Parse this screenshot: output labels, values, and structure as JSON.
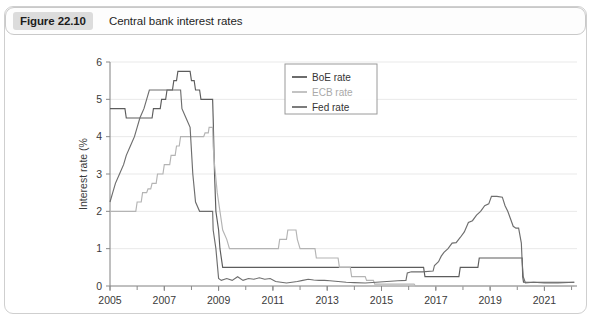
{
  "figure": {
    "badge": "Figure 22.10",
    "title": "Central bank interest rates"
  },
  "colors": {
    "boe": "#5c5c5c",
    "ecb": "#b4b4b4",
    "fed": "#6e6e6e",
    "axis": "#808080",
    "grid": "#e9e9e9",
    "badge_bg": "#dcdcdc"
  },
  "legend": {
    "position": "top-right",
    "entries": [
      {
        "label": "BoE rate",
        "color": "#5c5c5c"
      },
      {
        "label": "ECB rate",
        "color": "#b4b4b4"
      },
      {
        "label": "Fed rate",
        "color": "#6e6e6e"
      }
    ]
  },
  "axes": {
    "y": {
      "label": "Interest rate (%",
      "ticks": [
        "0",
        "1",
        "2",
        "3",
        "4",
        "5",
        "6"
      ],
      "min": 0,
      "max": 6
    },
    "x": {
      "label": "",
      "ticks": [
        "2005",
        "2007",
        "2009",
        "2011",
        "2013",
        "2015",
        "2017",
        "2019",
        "2021"
      ],
      "minor_ticks": [
        "2006",
        "2008",
        "2010",
        "2012",
        "2014",
        "2016",
        "2018",
        "2020",
        "2022"
      ],
      "min": 2005,
      "max": 2022.2
    }
  },
  "chart_data": {
    "type": "line",
    "title": "Central bank interest rates",
    "xlabel": "",
    "ylabel": "Interest rate (%)",
    "xlim": [
      2005,
      2022.2
    ],
    "ylim": [
      0,
      6
    ],
    "grid": true,
    "legend_position": "top-right",
    "series": [
      {
        "name": "BoE rate",
        "color": "#5c5c5c",
        "points": [
          [
            2005.0,
            4.75
          ],
          [
            2005.55,
            4.75
          ],
          [
            2005.6,
            4.5
          ],
          [
            2006.55,
            4.5
          ],
          [
            2006.6,
            4.75
          ],
          [
            2006.85,
            4.75
          ],
          [
            2006.9,
            5.0
          ],
          [
            2007.05,
            5.0
          ],
          [
            2007.1,
            5.25
          ],
          [
            2007.3,
            5.25
          ],
          [
            2007.35,
            5.5
          ],
          [
            2007.45,
            5.5
          ],
          [
            2007.5,
            5.75
          ],
          [
            2007.95,
            5.75
          ],
          [
            2008.0,
            5.5
          ],
          [
            2008.1,
            5.5
          ],
          [
            2008.15,
            5.25
          ],
          [
            2008.3,
            5.25
          ],
          [
            2008.35,
            5.0
          ],
          [
            2008.78,
            5.0
          ],
          [
            2008.8,
            4.5
          ],
          [
            2008.85,
            3.0
          ],
          [
            2008.9,
            2.0
          ],
          [
            2009.0,
            1.5
          ],
          [
            2009.05,
            1.0
          ],
          [
            2009.15,
            0.5
          ],
          [
            2016.55,
            0.5
          ],
          [
            2016.6,
            0.25
          ],
          [
            2017.85,
            0.25
          ],
          [
            2017.9,
            0.5
          ],
          [
            2018.55,
            0.5
          ],
          [
            2018.6,
            0.75
          ],
          [
            2020.18,
            0.75
          ],
          [
            2020.2,
            0.25
          ],
          [
            2020.23,
            0.1
          ],
          [
            2022.1,
            0.1
          ]
        ]
      },
      {
        "name": "ECB rate",
        "color": "#b4b4b4",
        "points": [
          [
            2005.0,
            2.0
          ],
          [
            2005.95,
            2.0
          ],
          [
            2006.0,
            2.25
          ],
          [
            2006.15,
            2.25
          ],
          [
            2006.2,
            2.5
          ],
          [
            2006.35,
            2.5
          ],
          [
            2006.4,
            2.6
          ],
          [
            2006.5,
            2.6
          ],
          [
            2006.55,
            2.75
          ],
          [
            2006.7,
            2.75
          ],
          [
            2006.75,
            3.0
          ],
          [
            2006.95,
            3.0
          ],
          [
            2007.0,
            3.25
          ],
          [
            2007.2,
            3.25
          ],
          [
            2007.25,
            3.5
          ],
          [
            2007.4,
            3.5
          ],
          [
            2007.45,
            3.75
          ],
          [
            2007.55,
            3.75
          ],
          [
            2007.6,
            4.0
          ],
          [
            2008.45,
            4.0
          ],
          [
            2008.5,
            4.1
          ],
          [
            2008.62,
            4.1
          ],
          [
            2008.65,
            4.25
          ],
          [
            2008.78,
            4.25
          ],
          [
            2008.8,
            3.75
          ],
          [
            2008.85,
            3.25
          ],
          [
            2008.95,
            2.5
          ],
          [
            2009.05,
            2.0
          ],
          [
            2009.15,
            1.5
          ],
          [
            2009.3,
            1.25
          ],
          [
            2009.4,
            1.0
          ],
          [
            2011.2,
            1.0
          ],
          [
            2011.25,
            1.25
          ],
          [
            2011.5,
            1.25
          ],
          [
            2011.55,
            1.5
          ],
          [
            2011.85,
            1.5
          ],
          [
            2011.9,
            1.25
          ],
          [
            2012.0,
            1.0
          ],
          [
            2012.55,
            1.0
          ],
          [
            2012.6,
            0.75
          ],
          [
            2013.4,
            0.75
          ],
          [
            2013.45,
            0.5
          ],
          [
            2013.85,
            0.5
          ],
          [
            2013.9,
            0.25
          ],
          [
            2014.4,
            0.25
          ],
          [
            2014.45,
            0.15
          ],
          [
            2014.7,
            0.15
          ],
          [
            2014.75,
            0.05
          ],
          [
            2016.2,
            0.05
          ],
          [
            2016.25,
            0.0
          ],
          [
            2022.1,
            0.0
          ]
        ]
      },
      {
        "name": "Fed rate",
        "color": "#6e6e6e",
        "points": [
          [
            2005.0,
            2.25
          ],
          [
            2005.1,
            2.5
          ],
          [
            2005.2,
            2.75
          ],
          [
            2005.35,
            3.0
          ],
          [
            2005.5,
            3.25
          ],
          [
            2005.6,
            3.5
          ],
          [
            2005.75,
            3.75
          ],
          [
            2005.9,
            4.0
          ],
          [
            2006.0,
            4.25
          ],
          [
            2006.1,
            4.5
          ],
          [
            2006.25,
            4.75
          ],
          [
            2006.35,
            5.0
          ],
          [
            2006.45,
            5.25
          ],
          [
            2007.6,
            5.25
          ],
          [
            2007.65,
            4.75
          ],
          [
            2007.8,
            4.5
          ],
          [
            2007.95,
            4.25
          ],
          [
            2008.05,
            3.0
          ],
          [
            2008.15,
            2.25
          ],
          [
            2008.3,
            2.0
          ],
          [
            2008.78,
            2.0
          ],
          [
            2008.8,
            1.5
          ],
          [
            2008.9,
            1.0
          ],
          [
            2009.0,
            0.2
          ],
          [
            2009.1,
            0.15
          ],
          [
            2009.3,
            0.2
          ],
          [
            2009.5,
            0.15
          ],
          [
            2009.7,
            0.25
          ],
          [
            2009.9,
            0.15
          ],
          [
            2010.1,
            0.2
          ],
          [
            2010.3,
            0.18
          ],
          [
            2010.5,
            0.22
          ],
          [
            2010.7,
            0.18
          ],
          [
            2010.9,
            0.2
          ],
          [
            2011.1,
            0.12
          ],
          [
            2011.3,
            0.1
          ],
          [
            2011.5,
            0.08
          ],
          [
            2011.7,
            0.1
          ],
          [
            2011.9,
            0.12
          ],
          [
            2012.1,
            0.15
          ],
          [
            2012.3,
            0.18
          ],
          [
            2012.5,
            0.16
          ],
          [
            2012.7,
            0.15
          ],
          [
            2012.9,
            0.15
          ],
          [
            2013.1,
            0.14
          ],
          [
            2013.4,
            0.12
          ],
          [
            2013.7,
            0.1
          ],
          [
            2014.0,
            0.09
          ],
          [
            2014.4,
            0.08
          ],
          [
            2014.8,
            0.1
          ],
          [
            2015.2,
            0.12
          ],
          [
            2015.6,
            0.14
          ],
          [
            2015.9,
            0.15
          ],
          [
            2015.95,
            0.35
          ],
          [
            2016.1,
            0.38
          ],
          [
            2016.5,
            0.38
          ],
          [
            2016.9,
            0.4
          ],
          [
            2016.95,
            0.55
          ],
          [
            2017.1,
            0.65
          ],
          [
            2017.2,
            0.8
          ],
          [
            2017.3,
            0.9
          ],
          [
            2017.45,
            1.0
          ],
          [
            2017.6,
            1.15
          ],
          [
            2017.75,
            1.16
          ],
          [
            2017.9,
            1.3
          ],
          [
            2018.05,
            1.45
          ],
          [
            2018.2,
            1.7
          ],
          [
            2018.35,
            1.75
          ],
          [
            2018.5,
            1.9
          ],
          [
            2018.65,
            2.0
          ],
          [
            2018.8,
            2.15
          ],
          [
            2018.95,
            2.2
          ],
          [
            2019.05,
            2.4
          ],
          [
            2019.25,
            2.4
          ],
          [
            2019.45,
            2.38
          ],
          [
            2019.55,
            2.15
          ],
          [
            2019.65,
            2.0
          ],
          [
            2019.75,
            1.8
          ],
          [
            2019.85,
            1.6
          ],
          [
            2019.95,
            1.55
          ],
          [
            2020.05,
            1.55
          ],
          [
            2020.15,
            1.15
          ],
          [
            2020.18,
            0.65
          ],
          [
            2020.22,
            0.25
          ],
          [
            2020.3,
            0.08
          ],
          [
            2020.6,
            0.1
          ],
          [
            2021.0,
            0.08
          ],
          [
            2021.5,
            0.08
          ],
          [
            2022.1,
            0.1
          ]
        ]
      }
    ]
  }
}
